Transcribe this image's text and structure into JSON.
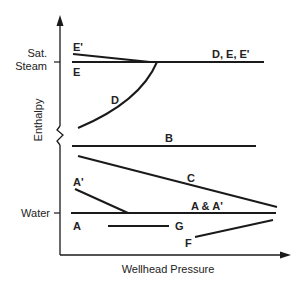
{
  "diagram": {
    "x_axis_label": "Wellhead Pressure",
    "y_axis_label": "Enthalpy",
    "y_markers": {
      "sat_steam_line1": "Sat.",
      "sat_steam_line2": "Steam",
      "water": "Water"
    },
    "curve_labels": {
      "e_prime": "E'",
      "e": "E",
      "d_e_eprime": "D, E, E'",
      "d": "D",
      "b": "B",
      "c": "C",
      "a_prime": "A'",
      "a_and_a_prime": "A & A'",
      "a": "A",
      "g": "G",
      "f": "F"
    },
    "colors": {
      "line": "#1a1a1a",
      "text": "#222222",
      "background": "#ffffff"
    }
  }
}
